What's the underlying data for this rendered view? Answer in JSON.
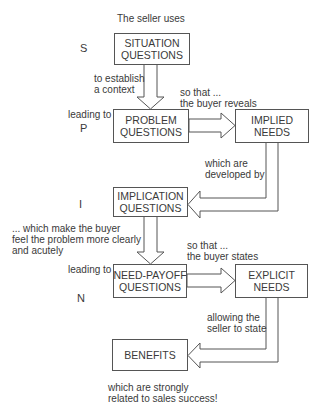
{
  "intro": "The seller uses",
  "stages": {
    "s": "S",
    "p": "P",
    "i": "I",
    "n": "N"
  },
  "boxes": {
    "situation": "SITUATION\nQUESTIONS",
    "problem": "PROBLEM\nQUESTIONS",
    "implied": "IMPLIED\nNEEDS",
    "implication": "IMPLICATION\nQUESTIONS",
    "need_payoff": "NEED-PAYOFF\nQUESTIONS",
    "explicit": "EXPLICIT\nNEEDS",
    "benefits": "BENEFITS"
  },
  "labels": {
    "establish_context": "to establish\na context",
    "leading_to_1": "leading to",
    "buyer_reveals": "so that ...\nthe buyer reveals",
    "developed_by": "which are\ndeveloped by",
    "make_buyer_feel": "... which make the buyer\nfeel the problem more clearly\nand acutely",
    "leading_to_2": "leading to",
    "buyer_states": "so that ...\nthe buyer states",
    "seller_to_state": "allowing the\nseller to state",
    "sales_success": "which are strongly\nrelated to sales success!"
  }
}
